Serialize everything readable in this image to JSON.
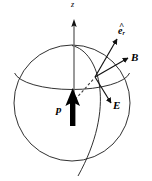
{
  "figure": {
    "background_color": "#ffffff",
    "width": 152,
    "height": 181,
    "labels": {
      "z_axis": "z",
      "unit_radial": "e",
      "unit_radial_subscript": "r",
      "unit_radial_hat": "^",
      "magnetic_field": "B",
      "electric_field": "E",
      "dipole_moment": "p"
    },
    "colors": {
      "outline": "#1a1a1a",
      "axis": "#6e6e6e",
      "vector": "#111111",
      "dipole": "#000000",
      "dashed": "#3a3a3a"
    },
    "geometry": {
      "sphere_center_x": 72,
      "sphere_center_y": 103,
      "sphere_radius": 58,
      "field_point_x": 95,
      "field_point_y": 77,
      "z_axis_top_y": 20,
      "z_axis_bottom_y": 112
    },
    "elements": [
      {
        "name": "sphere-outline",
        "kind": "circle"
      },
      {
        "name": "equator-ellipse",
        "kind": "arc"
      },
      {
        "name": "meridian-ellipse",
        "kind": "arc"
      },
      {
        "name": "z-axis-arrow",
        "kind": "vector"
      },
      {
        "name": "dipole-arrow",
        "kind": "vector"
      },
      {
        "name": "radial-unit-vector-arrow",
        "kind": "vector"
      },
      {
        "name": "magnetic-field-arrow",
        "kind": "vector"
      },
      {
        "name": "electric-field-arrow",
        "kind": "vector"
      },
      {
        "name": "radius-dashed-line",
        "kind": "dashed-line"
      }
    ]
  }
}
